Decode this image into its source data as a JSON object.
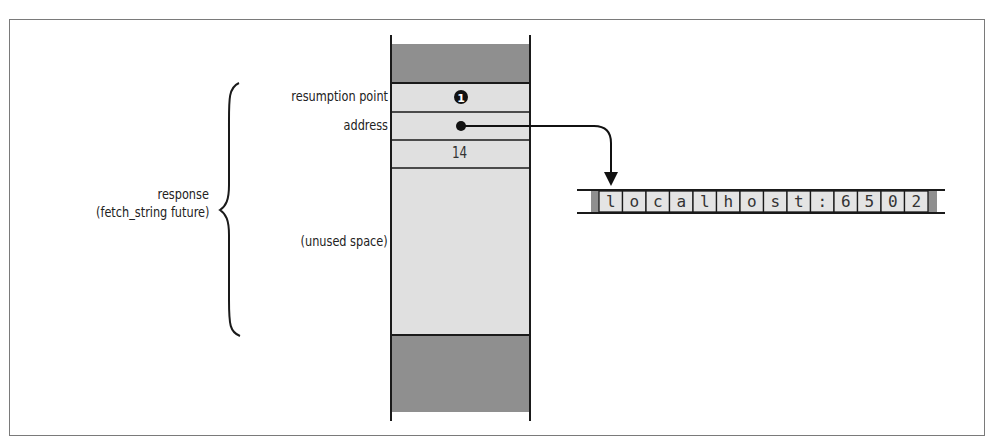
{
  "diagram": {
    "stack": {
      "rows": [
        {
          "label": "",
          "value": "",
          "fill": "#8f8f8f",
          "role": "used-above"
        },
        {
          "label": "resumption point",
          "value": "❶",
          "fill": "#e0e0e0"
        },
        {
          "label": "address",
          "value": "•",
          "fill": "#e0e0e0",
          "points_to": "string"
        },
        {
          "label": "",
          "value": "14",
          "fill": "#e0e0e0"
        },
        {
          "label": "(unused space)",
          "value": "",
          "fill": "#e0e0e0"
        },
        {
          "label": "",
          "value": "",
          "fill": "#8f8f8f",
          "role": "used-below"
        }
      ]
    },
    "group_label": {
      "line1": "response",
      "line2": "(fetch_string future)"
    },
    "string": {
      "chars": [
        "l",
        "o",
        "c",
        "a",
        "l",
        "h",
        "o",
        "s",
        "t",
        ":",
        "6",
        "5",
        "0",
        "2"
      ]
    },
    "colors": {
      "dark_fill": "#8f8f8f",
      "light_fill": "#e0e0e0",
      "line": "#1a1a1a"
    }
  }
}
